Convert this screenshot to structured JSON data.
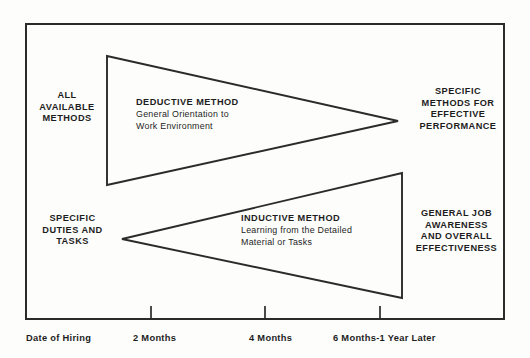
{
  "diagram": {
    "type": "two-opposing-triangles-timeline",
    "background_color": "#fdfdfc",
    "line_color": "#2b2b2b",
    "text_color": "#1d1d1d",
    "left_labels": [
      {
        "id": "all-available-methods",
        "lines": [
          "ALL",
          "AVAILABLE",
          "METHODS"
        ]
      },
      {
        "id": "specific-duties-and-tasks",
        "lines": [
          "SPECIFIC",
          "DUTIES AND",
          "TASKS"
        ]
      }
    ],
    "right_labels": [
      {
        "id": "specific-methods-for-effective-performance",
        "lines": [
          "SPECIFIC",
          "METHODS FOR",
          "EFFECTIVE",
          "PERFORMANCE"
        ]
      },
      {
        "id": "general-job-awareness-and-overall-effectiveness",
        "lines": [
          "GENERAL JOB",
          "AWARENESS",
          "AND OVERALL",
          "EFFECTIVENESS"
        ]
      }
    ],
    "triangles": [
      {
        "id": "deductive-method",
        "heading": "DEDUCTIVE METHOD",
        "body_lines": [
          "General Orientation to",
          "Work Environment"
        ],
        "orientation": "points-right",
        "base_x": 107,
        "base_top_y": 56,
        "base_bottom_y": 185,
        "apex_x": 398,
        "apex_y": 121
      },
      {
        "id": "inductive-method",
        "heading": "INDUCTIVE METHOD",
        "body_lines": [
          "Learning from the Detailed",
          "Material or Tasks"
        ],
        "orientation": "points-left",
        "base_x": 402,
        "base_top_y": 173,
        "base_bottom_y": 298,
        "apex_x": 122,
        "apex_y": 239
      }
    ]
  },
  "axis": {
    "id": "timeline-axis",
    "ticks": [
      {
        "label": "Date of Hiring",
        "x": 25
      },
      {
        "label": "2 Months",
        "x": 151
      },
      {
        "label": "4 Months",
        "x": 265
      },
      {
        "label": "6 Months-1 Year Later",
        "x": 380
      }
    ],
    "labels": [
      "Date of Hiring",
      "2 Months",
      "4 Months",
      "6 Months-1 Year Later"
    ]
  }
}
